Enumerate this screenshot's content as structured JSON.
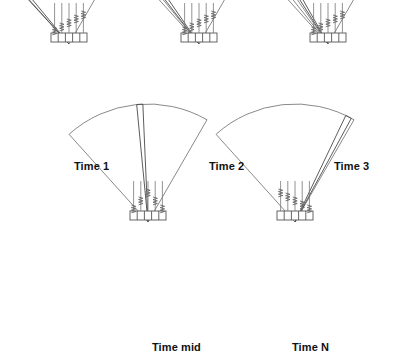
{
  "figure": {
    "background_color": "#ffffff",
    "line_color": "#6b6b6b",
    "beam_color": "#4a4a4a",
    "label_color": "#111111",
    "array_element_count": 5,
    "panel_count": 5
  },
  "panels": [
    {
      "id": "time-1",
      "label": "Time 1",
      "label_x": 74,
      "label_y": 160,
      "apex_x": 69,
      "apex_y": 44,
      "array_x": 51,
      "array_y": 33,
      "array_width": 36,
      "array_height": 9,
      "radius": 118,
      "left_angle_deg": -42,
      "right_angle_deg": 30,
      "beam_angle_deg": -41,
      "beam_width_deg": 3,
      "beam_position": "left-edge",
      "delay_profile": "left-steer"
    },
    {
      "id": "time-2",
      "label": "Time 2",
      "label_x": 209,
      "label_y": 160,
      "apex_x": 199,
      "apex_y": 44,
      "array_x": 181,
      "array_y": 33,
      "array_width": 36,
      "array_height": 9,
      "radius": 118,
      "left_angle_deg": -42,
      "right_angle_deg": 30,
      "beam_angle_deg": -36,
      "beam_width_deg": 3,
      "beam_position": "left",
      "delay_profile": "left-steer"
    },
    {
      "id": "time-3",
      "label": "Time 3",
      "label_x": 334,
      "label_y": 160,
      "apex_x": 328,
      "apex_y": 44,
      "array_x": 310,
      "array_y": 33,
      "array_width": 36,
      "array_height": 9,
      "radius": 118,
      "left_angle_deg": -42,
      "right_angle_deg": 30,
      "beam_angle_deg": -31,
      "beam_width_deg": 3,
      "beam_position": "left-inner",
      "delay_profile": "left-steer"
    },
    {
      "id": "time-mid",
      "label": "Time mid",
      "label_x": 152,
      "label_y": 341,
      "apex_x": 148,
      "apex_y": 222,
      "array_x": 130,
      "array_y": 211,
      "array_width": 36,
      "array_height": 9,
      "radius": 118,
      "left_angle_deg": -42,
      "right_angle_deg": 30,
      "beam_angle_deg": -4,
      "beam_width_deg": 3,
      "beam_position": "center",
      "delay_profile": "center-steer"
    },
    {
      "id": "time-n",
      "label": "Time N",
      "label_x": 292,
      "label_y": 341,
      "apex_x": 295,
      "apex_y": 222,
      "array_x": 277,
      "array_y": 211,
      "array_width": 36,
      "array_height": 9,
      "radius": 118,
      "left_angle_deg": -42,
      "right_angle_deg": 30,
      "beam_angle_deg": 27,
      "beam_width_deg": 3,
      "beam_position": "right-edge",
      "delay_profile": "right-steer"
    }
  ]
}
